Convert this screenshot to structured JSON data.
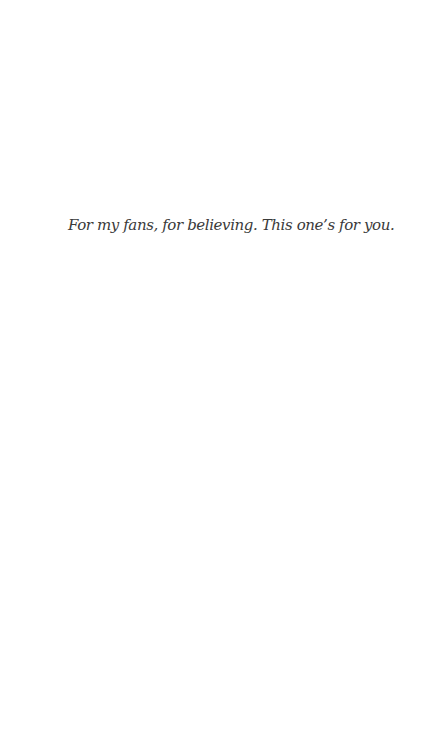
{
  "page": {
    "dedication": "For my fans, for believing. This one’s for you."
  }
}
